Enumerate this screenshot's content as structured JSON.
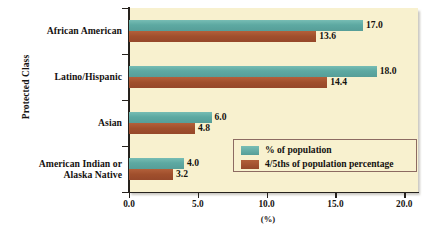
{
  "chart_data": {
    "type": "bar",
    "orientation": "horizontal",
    "title": "",
    "xlabel": "(%)",
    "ylabel": "Protected Class",
    "categories": [
      "African American",
      "Latino/Hispanic",
      "Asian",
      "American Indian or\nAlaska Native"
    ],
    "series": [
      {
        "name": "% of population",
        "color": "#63aea7",
        "values": [
          17.0,
          18.0,
          6.0,
          4.0
        ],
        "labels": [
          "17.0",
          "18.0",
          "6.0",
          "4.0"
        ]
      },
      {
        "name": "4/5ths of population percentage",
        "color": "#a8542f",
        "values": [
          13.6,
          14.4,
          4.8,
          3.2
        ],
        "labels": [
          "13.6",
          "14.4",
          "4.8",
          "3.2"
        ]
      }
    ],
    "xlim": [
      0.0,
      21.0
    ],
    "xticks": [
      0.0,
      5.0,
      10.0,
      15.0,
      20.0
    ],
    "xticklabels": [
      "0.0",
      "5.0",
      "10.0",
      "15.0",
      "20.0"
    ],
    "grid": false,
    "legend_position": "inside-lower-right",
    "plot_background": "#f8f1cf",
    "legend_border_color": "#8d6b62"
  },
  "axes": {
    "y_title": "Protected Class",
    "x_title": "(%)"
  },
  "legend": {
    "entries": [
      {
        "label": "% of population",
        "swatch": "pop"
      },
      {
        "label": "4/5ths of population percentage",
        "swatch": "four-fifths"
      }
    ]
  }
}
